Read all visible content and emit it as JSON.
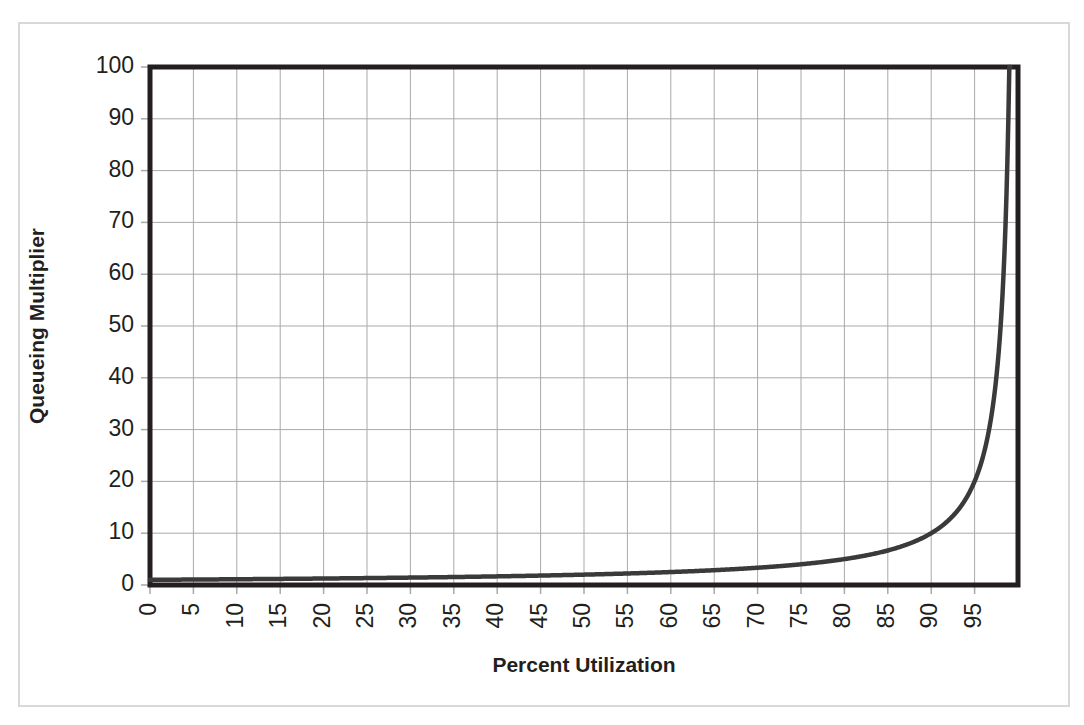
{
  "chart_data": {
    "type": "line",
    "title": "",
    "xlabel": "Percent Utilization",
    "ylabel": "Queueing Multiplier",
    "xlim": [
      0,
      100
    ],
    "ylim": [
      0,
      100
    ],
    "grid": true,
    "legend": null,
    "line_color": "#3a3a3a",
    "line_width": 4,
    "grid_color": "#a9a9a9",
    "axis_color": "#231f20",
    "background": "#ffffff",
    "xticks": [
      0,
      5,
      10,
      15,
      20,
      25,
      30,
      35,
      40,
      45,
      50,
      55,
      60,
      65,
      70,
      75,
      80,
      85,
      90,
      95
    ],
    "xtick_labels": [
      "0",
      "5",
      "10",
      "15",
      "20",
      "25",
      "30",
      "35",
      "40",
      "45",
      "50",
      "55",
      "60",
      "65",
      "70",
      "75",
      "80",
      "85",
      "90",
      "95"
    ],
    "xtick_rotation": 90,
    "yticks": [
      0,
      10,
      20,
      30,
      40,
      50,
      60,
      70,
      80,
      90,
      100
    ],
    "ytick_labels": [
      "0",
      "10",
      "20",
      "30",
      "40",
      "50",
      "60",
      "70",
      "80",
      "90",
      "100"
    ],
    "series": [
      {
        "name": "Queueing Multiplier",
        "formula": "1 / (1 - u/100)",
        "x": [
          0,
          5,
          10,
          15,
          20,
          25,
          30,
          35,
          40,
          45,
          50,
          55,
          60,
          65,
          70,
          72,
          74,
          76,
          78,
          80,
          82,
          84,
          86,
          88,
          90,
          91,
          92,
          93,
          94,
          95,
          95.5,
          96,
          96.5,
          97,
          97.5,
          98,
          98.3,
          98.6,
          98.8,
          99,
          99.1
        ],
        "y": [
          1,
          1.05,
          1.11,
          1.18,
          1.25,
          1.33,
          1.43,
          1.54,
          1.67,
          1.82,
          2,
          2.22,
          2.5,
          2.86,
          3.33,
          3.57,
          3.85,
          4.17,
          4.55,
          5,
          5.56,
          6.25,
          7.14,
          8.33,
          10,
          11.1,
          12.5,
          14.3,
          16.7,
          20,
          22.2,
          25,
          28.6,
          33.3,
          40,
          50,
          58.8,
          71.4,
          83.3,
          100,
          100
        ]
      }
    ],
    "annotations": []
  },
  "axes": {
    "x_title": "Percent Utilization",
    "y_title": "Queueing Multiplier"
  },
  "figure": {
    "frame_color": "#d8d8d8"
  }
}
